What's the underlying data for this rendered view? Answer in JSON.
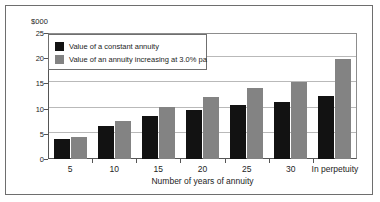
{
  "chart_data": {
    "type": "bar",
    "title": "",
    "subtitle": "",
    "unit_label": "$000",
    "xlabel": "Number of years of annuity",
    "ylabel": "",
    "categories": [
      "5",
      "10",
      "15",
      "20",
      "25",
      "30",
      "In perpetuity"
    ],
    "series": [
      {
        "name": "Value of a constant annuity",
        "color": "#121212",
        "values": [
          4.0,
          6.6,
          8.6,
          9.8,
          10.7,
          11.3,
          12.5
        ]
      },
      {
        "name": "Value of an annuity increasing at 3.0% pa",
        "color": "#838383",
        "values": [
          4.3,
          7.6,
          10.3,
          12.4,
          14.0,
          15.2,
          19.9
        ]
      }
    ],
    "ylim": [
      0,
      25
    ],
    "yticks": [
      0,
      5,
      10,
      15,
      20,
      25
    ],
    "ytick_labels": [
      "0",
      "5",
      "10",
      "15",
      "20",
      "25"
    ],
    "grid": true,
    "grid_axis": "y",
    "legend_position": "upper left",
    "legend_entries": [
      "Value of a constant annuity",
      "Value of an annuity increasing at 3.0% pa"
    ]
  }
}
